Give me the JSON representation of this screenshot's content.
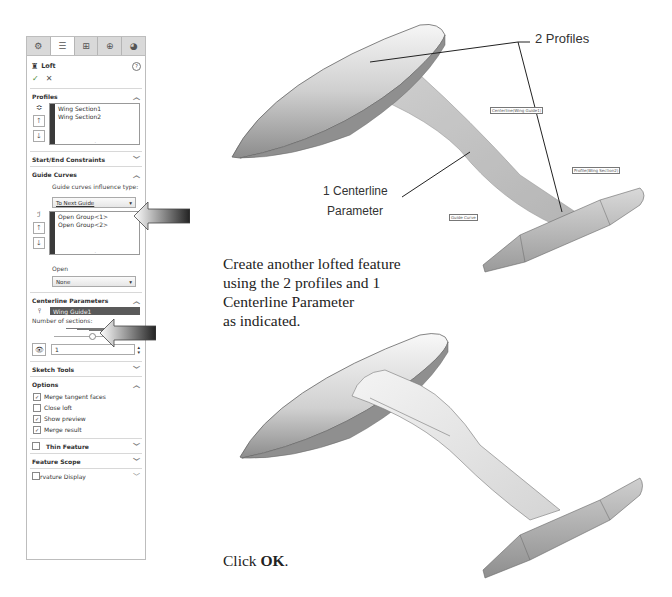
{
  "panel": {
    "tabs": [
      {
        "icon": "feature-manager-icon",
        "glyph": "⚙"
      },
      {
        "icon": "property-manager-icon",
        "glyph": "☰"
      },
      {
        "icon": "configuration-manager-icon",
        "glyph": "⊞"
      },
      {
        "icon": "dimxpert-icon",
        "glyph": "⊕"
      },
      {
        "icon": "display-manager-icon",
        "glyph": "◕"
      }
    ],
    "title": "Loft",
    "help_glyph": "?",
    "ok_glyph": "✓",
    "cancel_glyph": "✕",
    "profiles": {
      "header": "Profiles",
      "items": [
        "Wing Section1",
        "Wing Section2"
      ]
    },
    "start_end": {
      "header": "Start/End Constraints"
    },
    "guide_curves": {
      "header": "Guide Curves",
      "influence_label": "Guide curves influence type:",
      "influence_value": "To Next Guide",
      "items": [
        "Open Group<1>",
        "Open Group<2>"
      ],
      "open_label": "Open",
      "open_value": "None"
    },
    "centerline": {
      "header": "Centerline Parameters",
      "selected": "Wing Guide1",
      "sections_label": "Number of sections:",
      "sections_value": "1"
    },
    "sketch_tools": {
      "header": "Sketch Tools"
    },
    "options": {
      "header": "Options",
      "checks": [
        {
          "label": "Merge tangent faces",
          "checked": true
        },
        {
          "label": "Close loft",
          "checked": false
        },
        {
          "label": "Show preview",
          "checked": true
        },
        {
          "label": "Merge result",
          "checked": true
        }
      ]
    },
    "thin_feature": {
      "header": "Thin Feature"
    },
    "feature_scope": {
      "header": "Feature Scope"
    },
    "curvature_display": {
      "header": "rvature Display"
    }
  },
  "annotations": {
    "profiles": "2 Profiles",
    "centerline_line1": "1 Centerline",
    "centerline_line2": "Parameter",
    "tag_centerline": "Centerline(Wing Guide1)",
    "tag_profile": "Profile(Wing Section2)",
    "tag_guide": "Guide Curve"
  },
  "instructions": {
    "line1": "Create another lofted feature",
    "line2": "using the 2 profiles and 1",
    "line3": "Centerline Parameter",
    "line4": "as indicated.",
    "click_prefix": "Click ",
    "click_bold": "OK",
    "click_suffix": "."
  }
}
